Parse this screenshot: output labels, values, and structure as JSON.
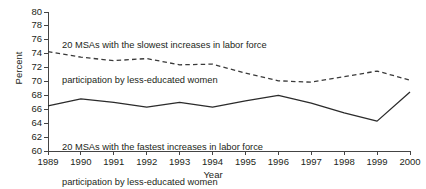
{
  "chart_data": {
    "type": "line",
    "title": "",
    "xlabel": "Year",
    "ylabel": "Percent",
    "x": [
      1989,
      1990,
      1991,
      1992,
      1993,
      1994,
      1995,
      1996,
      1997,
      1998,
      1999,
      2000
    ],
    "xlim": [
      1989,
      2000
    ],
    "ylim": [
      60,
      80
    ],
    "ytick_labels": [
      "80",
      "78",
      "76",
      "74",
      "72",
      "70",
      "68",
      "66",
      "64",
      "62",
      "60"
    ],
    "ytick_values": [
      80,
      78,
      76,
      74,
      72,
      70,
      68,
      66,
      64,
      62,
      60
    ],
    "xtick_labels": [
      "1989",
      "1990",
      "1991",
      "1992",
      "1993",
      "1994",
      "1995",
      "1996",
      "1997",
      "1998",
      "1999",
      "2000"
    ],
    "grid": false,
    "legend_position": "inline-annotations",
    "series": [
      {
        "name": "20 MSAs with the slowest increases in labor force participation by less-educated women",
        "style": "dashed",
        "color": "#3a3a3a",
        "values": [
          74.3,
          73.5,
          73.0,
          73.3,
          72.4,
          72.5,
          71.2,
          70.1,
          69.9,
          70.7,
          71.5,
          70.2
        ]
      },
      {
        "name": "20 MSAs with the fastest increases in labor force participation by less-educated women",
        "style": "solid",
        "color": "#2b2b2b",
        "values": [
          66.5,
          67.5,
          67.0,
          66.3,
          67.0,
          66.3,
          67.2,
          68.0,
          66.9,
          65.5,
          64.3,
          68.5
        ]
      }
    ],
    "annotations": [
      {
        "id": "annotation-slow",
        "line1": "20 MSAs with the slowest increases in labor force",
        "line2": "participation by less-educated women"
      },
      {
        "id": "annotation-fast",
        "line1": "20 MSAs with the fastest increases in labor force",
        "line2": "participation by less-educated women"
      }
    ]
  },
  "axis": {
    "y_title": "Percent",
    "x_title": "Year"
  },
  "annotations": {
    "slow": {
      "line1": "20 MSAs with the slowest increases in labor force",
      "line2": "participation by less-educated women"
    },
    "fast": {
      "line1": "20 MSAs with the fastest increases in labor force",
      "line2": "participation by less-educated women"
    }
  },
  "caption_strip": {
    "text": "                                                                                        "
  },
  "colors": {
    "axis": "#444444",
    "text": "#231f20",
    "series_solid": "#2b2b2b",
    "series_dashed": "#3a3a3a",
    "background": "#ffffff"
  }
}
